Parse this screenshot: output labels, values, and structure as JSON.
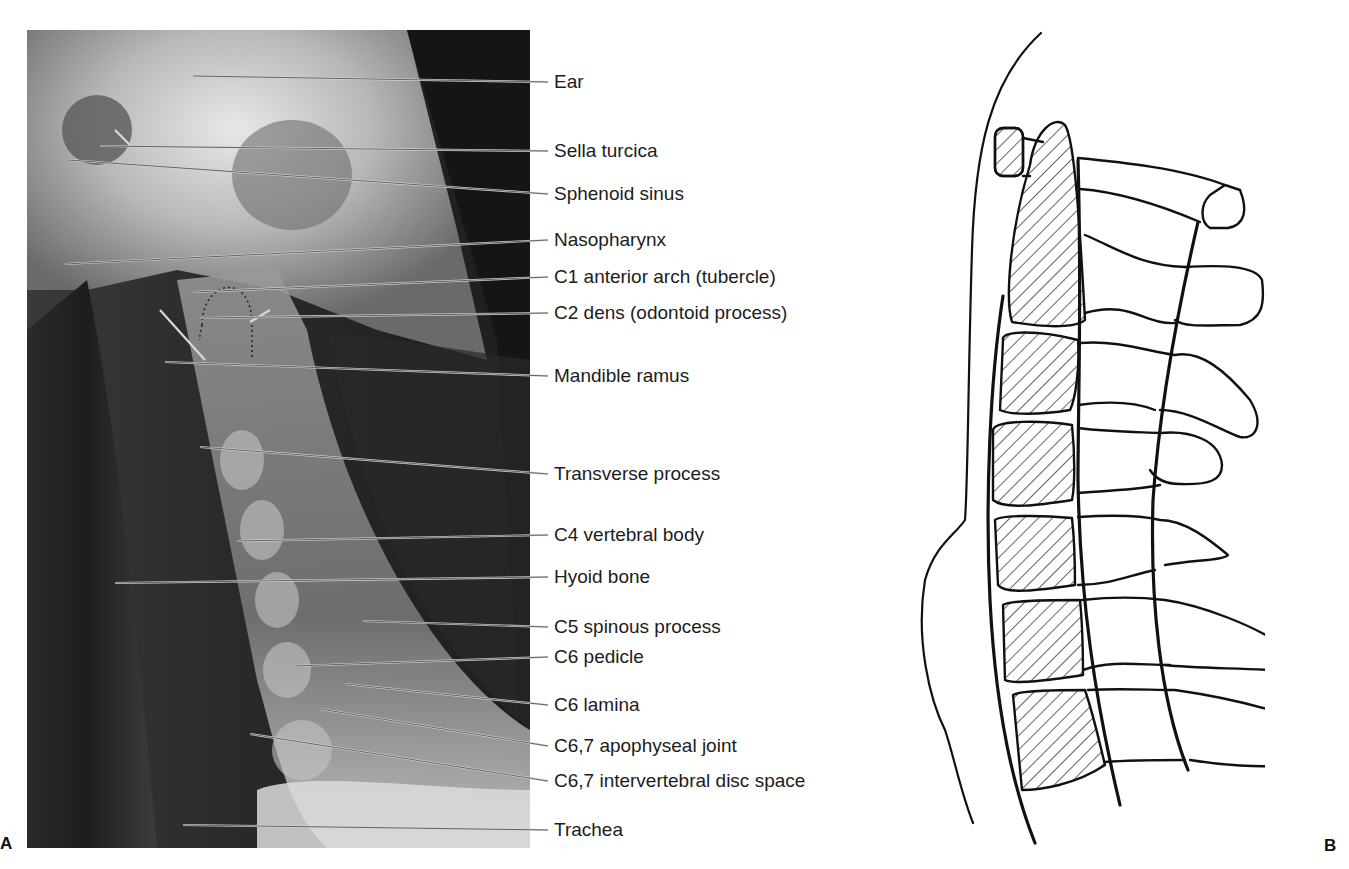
{
  "figure": {
    "panel_a_letter": "A",
    "panel_b_letter": "B",
    "panel_a_description": "Lateral cervical spine radiograph",
    "panel_b_description": "Line drawing of lateral cervical spine with hatched vertebral bodies"
  },
  "labels": [
    {
      "text": "Ear",
      "y": 82
    },
    {
      "text": "Sella turcica",
      "y": 151
    },
    {
      "text": "Sphenoid sinus",
      "y": 194
    },
    {
      "text": "Nasopharynx",
      "y": 240
    },
    {
      "text": "C1 anterior arch (tubercle)",
      "y": 277
    },
    {
      "text": "C2 dens (odontoid process)",
      "y": 313
    },
    {
      "text": "Mandible ramus",
      "y": 376
    },
    {
      "text": "Transverse process",
      "y": 474
    },
    {
      "text": "C4 vertebral body",
      "y": 535
    },
    {
      "text": "Hyoid bone",
      "y": 577
    },
    {
      "text": "C5 spinous process",
      "y": 627
    },
    {
      "text": "C6 pedicle",
      "y": 657
    },
    {
      "text": "C6 lamina",
      "y": 705
    },
    {
      "text": "C6,7 apophyseal joint",
      "y": 746
    },
    {
      "text": "C6,7 intervertebral disc space",
      "y": 781
    },
    {
      "text": "Trachea",
      "y": 830
    }
  ]
}
